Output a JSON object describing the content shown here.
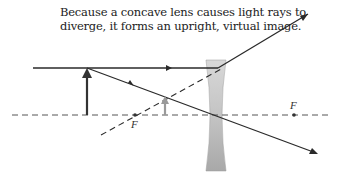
{
  "caption": {
    "line1": "Because a concave lens causes light rays to",
    "line2": "diverge, it forms an upright, virtual image."
  },
  "diagram": {
    "type": "concave-lens-ray-diagram",
    "focal_points": [
      {
        "label": "F",
        "side": "left"
      },
      {
        "label": "F",
        "side": "right"
      }
    ],
    "object": {
      "label": "object",
      "orientation": "upright",
      "color": "#333333"
    },
    "image": {
      "label": "virtual image",
      "orientation": "upright",
      "color": "#9a9a9a"
    },
    "lens": {
      "type": "concave",
      "color": "#b0b0b0"
    },
    "colors": {
      "ray": "#2a2a2a",
      "axis": "#555555",
      "background": "#ffffff"
    }
  }
}
